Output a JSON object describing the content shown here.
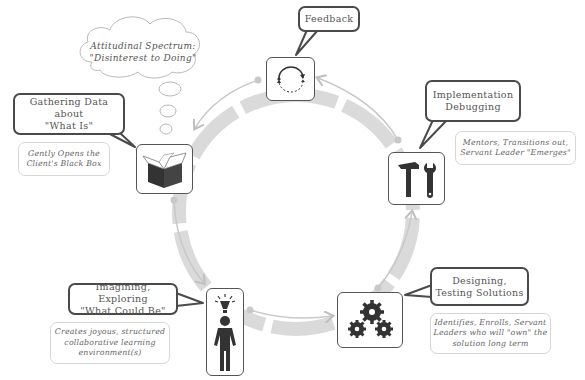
{
  "diagram": {
    "type": "cycle",
    "colors": {
      "ring": "#d9d9d9",
      "connector": "#c8c8c8",
      "border": "#4a4a4a",
      "icon": "#3a3a3a",
      "text": "#555555"
    },
    "thought_cloud": {
      "line1": "Attitudinal Spectrum:",
      "line2": "\"Disinterest to Doing\""
    },
    "stages": [
      {
        "id": "feedback",
        "title": "Feedback",
        "icon": "cycle-arrows-icon",
        "note": ""
      },
      {
        "id": "implementation",
        "title": "Implementation\nDebugging",
        "icon": "hammer-wrench-icon",
        "note": "Mentors, Transitions out,\nServant Leader \"Emerges\""
      },
      {
        "id": "designing",
        "title": "Designing,\nTesting Solutions",
        "icon": "gears-icon",
        "note": "Identifies, Enrolls, Servant\nLeaders who will \"own\" the\nsolution long term"
      },
      {
        "id": "imagining",
        "title": "Imagining, Exploring\n\"What Could Be\"",
        "icon": "person-lightbulb-icon",
        "note": "Creates joyous, structured\ncollaborative learning\nenvironment(s)"
      },
      {
        "id": "gathering",
        "title": "Gathering Data about\n\"What Is\"",
        "icon": "open-box-icon",
        "note": "Gently Opens the\nClient's Black Box"
      }
    ]
  }
}
